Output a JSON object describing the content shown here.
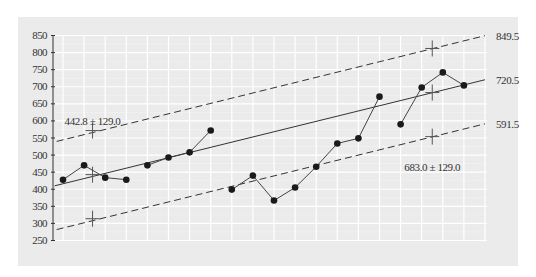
{
  "chart_data": {
    "type": "line",
    "title": "",
    "xlabel": "",
    "ylabel": "",
    "ylim": [
      250,
      850
    ],
    "yticks": [
      250,
      300,
      350,
      400,
      450,
      500,
      550,
      600,
      650,
      700,
      750,
      800,
      850
    ],
    "grid": true,
    "x_count": 21,
    "series": [
      {
        "name": "observations",
        "style": "line-markers",
        "segments": [
          {
            "x": [
              0,
              1,
              2,
              3
            ],
            "values": [
              428,
              470,
              434,
              428
            ]
          },
          {
            "x": [
              4,
              5,
              6,
              7
            ],
            "values": [
              470,
              493,
              508,
              572
            ]
          },
          {
            "x": [
              8,
              9,
              10,
              11,
              12,
              13,
              14,
              15
            ],
            "values": [
              399,
              440,
              367,
              405,
              466,
              534,
              549,
              671
            ]
          },
          {
            "x": [
              16,
              17,
              18,
              19
            ],
            "values": [
              590,
              698,
              742,
              704
            ]
          }
        ]
      },
      {
        "name": "trend",
        "style": "solid",
        "x": [
          -0.4,
          20
        ],
        "values": [
          410,
          720.5
        ]
      },
      {
        "name": "upper band",
        "style": "dashed",
        "x": [
          -0.3,
          20
        ],
        "values": [
          540,
          849.5
        ]
      },
      {
        "name": "lower band",
        "style": "dashed",
        "x": [
          -0.3,
          20
        ],
        "values": [
          282,
          591.5
        ]
      }
    ],
    "markers_cross": [
      {
        "x": 1.4,
        "values": [
          571.8,
          442.8,
          313.8
        ]
      },
      {
        "x": 17.5,
        "values": [
          812.0,
          683.0,
          554.0
        ]
      }
    ],
    "annotations": [
      {
        "text": "442.8 ± 129.0",
        "x": 1.4,
        "y": 600
      },
      {
        "text": "683.0 ± 129.0",
        "x": 17.5,
        "y": 466
      },
      {
        "text": "849.5",
        "x": 20,
        "y": 849.5,
        "position": "right"
      },
      {
        "text": "720.5",
        "x": 20,
        "y": 720.5,
        "position": "right"
      },
      {
        "text": "591.5",
        "x": 20,
        "y": 591.5,
        "position": "right"
      }
    ]
  },
  "colors": {
    "panel_bg": "#ebebeb",
    "grid": "#ffffff",
    "line": "#333333",
    "marker": "#1a1a1a",
    "text": "#333333"
  }
}
